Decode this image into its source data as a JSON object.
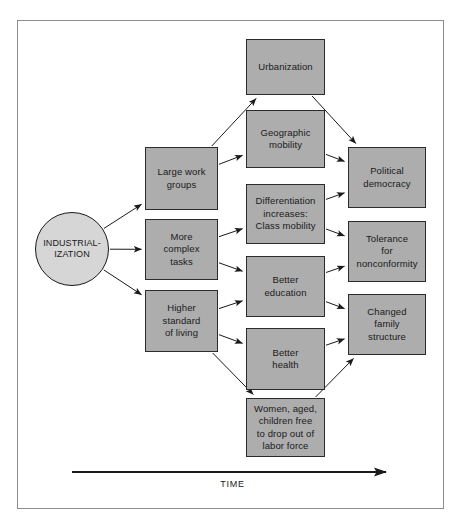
{
  "diagram": {
    "axis_label": "TIME",
    "colors": {
      "box_fill": "#adadad",
      "box_border": "#2b2b2b",
      "circle_fill": "#d6d6d6",
      "frame_border": "#8c8c8c",
      "arrow": "#1a1a1a",
      "background": "#ffffff"
    },
    "nodes": [
      {
        "id": "industrialization",
        "label": "INDUSTRIAL-\nIZATION",
        "shape": "circle",
        "x": 35,
        "y": 212,
        "w": 74,
        "h": 74
      },
      {
        "id": "large-work-groups",
        "label": "Large work\ngroups",
        "shape": "rect",
        "x": 145,
        "y": 147,
        "w": 73,
        "h": 63
      },
      {
        "id": "more-complex-tasks",
        "label": "More\ncomplex\ntasks",
        "shape": "rect",
        "x": 145,
        "y": 219,
        "w": 73,
        "h": 61
      },
      {
        "id": "higher-standard-of-living",
        "label": "Higher\nstandard\nof living",
        "shape": "rect",
        "x": 145,
        "y": 290,
        "w": 73,
        "h": 62
      },
      {
        "id": "urbanization",
        "label": "Urbanization",
        "shape": "rect",
        "x": 246,
        "y": 39,
        "w": 79,
        "h": 56
      },
      {
        "id": "geographic-mobility",
        "label": "Geographic\nmobility",
        "shape": "rect",
        "x": 246,
        "y": 110,
        "w": 79,
        "h": 58
      },
      {
        "id": "differentiation-class-mobility",
        "label": "Differentiation\nincreases:\nClass mobility",
        "shape": "rect",
        "x": 246,
        "y": 184,
        "w": 79,
        "h": 60
      },
      {
        "id": "better-education",
        "label": "Better\neducation",
        "shape": "rect",
        "x": 246,
        "y": 256,
        "w": 79,
        "h": 61
      },
      {
        "id": "better-health",
        "label": "Better\nhealth",
        "shape": "rect",
        "x": 246,
        "y": 328,
        "w": 79,
        "h": 62
      },
      {
        "id": "women-aged-children-free",
        "label": "Women, aged,\nchildren free\nto drop out of\nlabor force",
        "shape": "rect",
        "x": 246,
        "y": 398,
        "w": 79,
        "h": 59
      },
      {
        "id": "political-democracy",
        "label": "Political\ndemocracy",
        "shape": "rect",
        "x": 348,
        "y": 147,
        "w": 78,
        "h": 61
      },
      {
        "id": "tolerance-for-nonconformity",
        "label": "Tolerance\nfor\nnonconformity",
        "shape": "rect",
        "x": 348,
        "y": 221,
        "w": 78,
        "h": 61
      },
      {
        "id": "changed-family-structure",
        "label": "Changed\nfamily\nstructure",
        "shape": "rect",
        "x": 348,
        "y": 294,
        "w": 78,
        "h": 61
      }
    ],
    "edges": [
      {
        "from": "industrialization",
        "to": "large-work-groups"
      },
      {
        "from": "industrialization",
        "to": "more-complex-tasks"
      },
      {
        "from": "industrialization",
        "to": "higher-standard-of-living"
      },
      {
        "from": "large-work-groups",
        "to": "urbanization"
      },
      {
        "from": "large-work-groups",
        "to": "geographic-mobility"
      },
      {
        "from": "more-complex-tasks",
        "to": "differentiation-class-mobility"
      },
      {
        "from": "more-complex-tasks",
        "to": "better-education"
      },
      {
        "from": "higher-standard-of-living",
        "to": "better-education"
      },
      {
        "from": "higher-standard-of-living",
        "to": "better-health"
      },
      {
        "from": "higher-standard-of-living",
        "to": "women-aged-children-free"
      },
      {
        "from": "urbanization",
        "to": "political-democracy"
      },
      {
        "from": "geographic-mobility",
        "to": "political-democracy"
      },
      {
        "from": "differentiation-class-mobility",
        "to": "political-democracy"
      },
      {
        "from": "differentiation-class-mobility",
        "to": "tolerance-for-nonconformity"
      },
      {
        "from": "better-education",
        "to": "tolerance-for-nonconformity"
      },
      {
        "from": "better-education",
        "to": "changed-family-structure"
      },
      {
        "from": "better-health",
        "to": "changed-family-structure"
      },
      {
        "from": "women-aged-children-free",
        "to": "changed-family-structure"
      }
    ],
    "time_axis": {
      "x1": 72,
      "x2": 386,
      "y": 472
    }
  }
}
